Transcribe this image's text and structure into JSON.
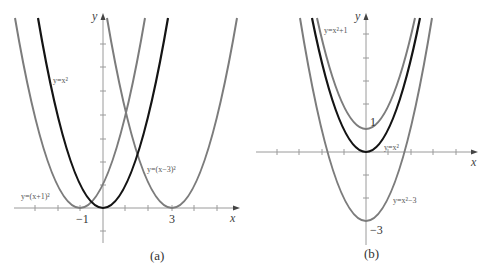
{
  "colors": {
    "axis": "#9a9a9a",
    "gray_curve": "#7c7c7c",
    "black_curve": "#141414",
    "text": "#333333"
  },
  "panel_a": {
    "caption": "(a)",
    "x_axis_label": "x",
    "y_axis_label": "y",
    "tick_labels": {
      "neg1": "−1",
      "three": "3"
    },
    "curves": [
      {
        "label": "y=x²",
        "equation": "y = x^2",
        "color": "black",
        "vertex": [
          0,
          0
        ]
      },
      {
        "label": "y=(x+1)²",
        "equation": "y = (x+1)^2",
        "color": "gray",
        "vertex": [
          -1,
          0
        ]
      },
      {
        "label": "y=(x−3)²",
        "equation": "y = (x-3)^2",
        "color": "gray",
        "vertex": [
          3,
          0
        ]
      }
    ]
  },
  "panel_b": {
    "caption": "(b)",
    "x_axis_label": "x",
    "y_axis_label": "y",
    "tick_labels": {
      "one": "1",
      "neg3": "−3"
    },
    "curves": [
      {
        "label": "y=x²+1",
        "equation": "y = x^2 + 1",
        "color": "gray",
        "vertex": [
          0,
          1
        ]
      },
      {
        "label": "y=x²",
        "equation": "y = x^2",
        "color": "black",
        "vertex": [
          0,
          0
        ]
      },
      {
        "label": "y=x²−3",
        "equation": "y = x^2 - 3",
        "color": "gray",
        "vertex": [
          0,
          -3
        ]
      }
    ]
  }
}
